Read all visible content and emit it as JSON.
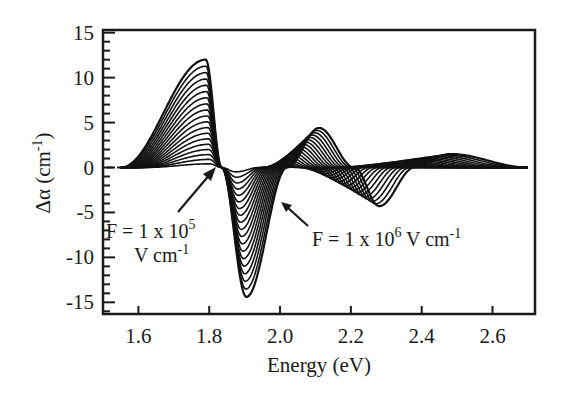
{
  "chart_data": {
    "type": "line",
    "title": "",
    "xlabel": "Energy (eV)",
    "ylabel": "Δα (cm⁻¹)",
    "ylabel_parts": {
      "main": "Δα (cm",
      "sup": "-1",
      "end": ")"
    },
    "xlim": [
      1.5,
      2.72
    ],
    "ylim": [
      -16.3,
      15.3
    ],
    "x_ticks": [
      1.6,
      1.8,
      2.0,
      2.2,
      2.4,
      2.6
    ],
    "x_tick_labels": [
      "1.6",
      "1.8",
      "2.0",
      "2.2",
      "2.4",
      "2.6"
    ],
    "y_ticks": [
      15,
      10,
      5,
      0,
      -5,
      -10,
      -15
    ],
    "y_tick_labels": [
      "15",
      "10",
      "5",
      "0",
      "-5",
      "-10",
      "-15"
    ],
    "y_minor_step": 1,
    "grid": false,
    "legend": "none",
    "series_description": "Family of electroabsorption spectra for applied fields from 1e5 to 1e6 V/cm; amplitude grows with field",
    "series_count": 19,
    "field_min_V_per_cm": 100000,
    "field_max_V_per_cm": 1000000,
    "key_features_max_field": [
      {
        "E": 1.55,
        "value": 0.0,
        "note": "onset"
      },
      {
        "E": 1.79,
        "value": 12.0,
        "note": "positive peak"
      },
      {
        "E": 1.835,
        "value": 0.0,
        "note": "zero crossing"
      },
      {
        "E": 1.905,
        "value": -14.4,
        "note": "negative peak"
      },
      {
        "E": 2.02,
        "value": 0.0,
        "note": "zero crossing"
      },
      {
        "E": 2.11,
        "value": 4.4,
        "note": "positive peak"
      },
      {
        "E": 2.21,
        "value": 0.0,
        "note": "zero crossing"
      },
      {
        "E": 2.28,
        "value": -4.3,
        "note": "negative peak"
      },
      {
        "E": 2.38,
        "value": 0.0,
        "note": "zero crossing"
      },
      {
        "E": 2.48,
        "value": 1.5,
        "note": "positive peak"
      },
      {
        "E": 2.7,
        "value": 0.0,
        "note": "tail"
      }
    ],
    "annotations": [
      {
        "id": "low",
        "line1": "F = 1 x 10",
        "sup1": "5",
        "line2": "V cm",
        "sup2": "-1",
        "arrow_to": {
          "E": 1.835,
          "value": 0.0
        }
      },
      {
        "id": "high",
        "text": "F = 1 x 10",
        "sup": "6",
        "tail": " V cm",
        "sup2": "-1",
        "arrow_to": {
          "E": 2.005,
          "value": -4.0
        }
      }
    ]
  }
}
